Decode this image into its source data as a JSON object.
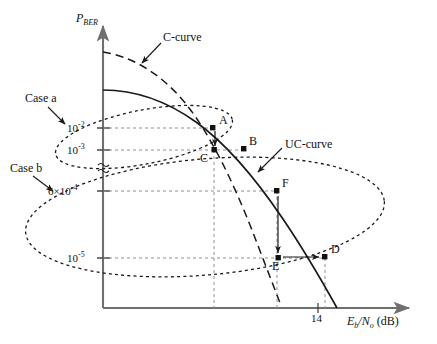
{
  "figure": {
    "background_color": "#ffffff",
    "line_color": "#1a1a1a",
    "axis_color": "#7a7a7a",
    "width": 437,
    "height": 344
  },
  "axes": {
    "y_axis_label": "P",
    "y_axis_label_sub": "BER",
    "x_axis_label_main": "E",
    "x_axis_label_sub_b": "b",
    "x_axis_label_slash": "/N",
    "x_axis_label_sub_o": "o",
    "x_axis_label_unit": "(dB)",
    "origin_x": 103,
    "origin_y": 308,
    "x_axis_end": 415,
    "y_axis_top": 22,
    "axis_break_symbol": "≈"
  },
  "y_ticks": [
    {
      "label_mantissa": "10",
      "label_exp": "-2",
      "label_full": "10⁻²",
      "y": 128
    },
    {
      "label_mantissa": "10",
      "label_exp": "-3",
      "label_full": "10⁻³",
      "y": 150
    },
    {
      "label_mantissa": "6×10",
      "label_exp": "-4",
      "label_full": "6×10⁻⁴",
      "y": 191
    },
    {
      "label_mantissa": "10",
      "label_exp": "-5",
      "label_full": "10⁻⁵",
      "y": 258
    }
  ],
  "x_ticks": [
    {
      "label": "14",
      "x": 318
    }
  ],
  "curves": [
    {
      "name": "C-curve",
      "style": "dashed",
      "label": "C-curve"
    },
    {
      "name": "UC-curve",
      "style": "solid",
      "label": "UC-curve"
    }
  ],
  "annotations": {
    "c_curve_label": "C-curve",
    "uc_curve_label": "UC-curve",
    "case_a_label": "Case a",
    "case_b_label": "Case b"
  },
  "points": [
    {
      "id": "A",
      "label": "A",
      "x": 213,
      "y": 128,
      "label_dx": 6,
      "label_dy": -14
    },
    {
      "id": "B",
      "label": "B",
      "x": 244,
      "y": 149,
      "label_dx": 5,
      "label_dy": -14
    },
    {
      "id": "C",
      "label": "C",
      "x": 214,
      "y": 150,
      "label_dx": -13,
      "label_dy": 3
    },
    {
      "id": "F",
      "label": "F",
      "x": 277,
      "y": 191,
      "label_dx": 5,
      "label_dy": -14
    },
    {
      "id": "E",
      "label": "E",
      "x": 278,
      "y": 258,
      "label_dx": -5,
      "label_dy": 3
    },
    {
      "id": "D",
      "label": "D",
      "x": 325,
      "y": 257,
      "label_dx": 6,
      "label_dy": -14
    }
  ],
  "ellipses": [
    {
      "name": "case-a-ellipse",
      "cx": 144,
      "cy": 137,
      "rx": 90,
      "ry": 27,
      "rotation": -11
    },
    {
      "name": "case-b-ellipse",
      "cx": 205,
      "cy": 217,
      "rx": 180,
      "ry": 58,
      "rotation": -5
    }
  ],
  "transition_arrows": [
    {
      "name": "a-to-c-arrow",
      "from": "A",
      "to": "C",
      "direction": "down"
    },
    {
      "name": "f-to-e-arrow",
      "from": "F",
      "to": "E",
      "direction": "down"
    },
    {
      "name": "e-to-d-arrow",
      "from": "E",
      "to": "D",
      "direction": "right"
    }
  ]
}
